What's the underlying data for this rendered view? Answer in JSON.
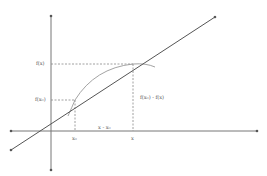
{
  "diagram": {
    "colors": {
      "background": "#ffffff",
      "axis": "#666666",
      "line": "#555555",
      "curve": "#999999",
      "dashed": "#888888",
      "label": "#555555"
    },
    "labels": {
      "f_x": "f(x)",
      "f_x0": "f(x₀)",
      "x0": "x₀",
      "x": "x",
      "delta_x": "x - x₀",
      "delta_y": "f(x₀) - f(x)"
    },
    "elements": {
      "x_axis": "horizontal axis with arrows at both ends",
      "y_axis": "vertical axis with arrows at both ends",
      "secant_line": "straight line passing through (x₀, f(x₀)) and (x, f(x))",
      "curve": "function curve f",
      "guides": "dashed projection lines to axes"
    }
  }
}
